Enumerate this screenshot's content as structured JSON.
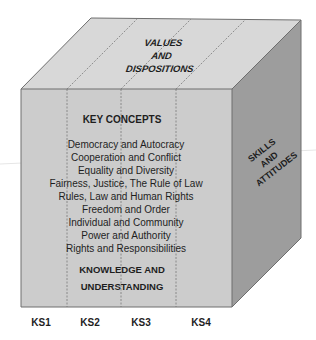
{
  "top_face": {
    "lines": [
      "VALUES",
      "AND",
      "DISPOSITIONS"
    ]
  },
  "front_face": {
    "heading": "KEY CONCEPTS",
    "concepts": [
      "Democracy and Autocracy",
      "Cooperation and Conflict",
      "Equality and Diversity",
      "Fairness, Justice, The Rule of Law",
      "Rules, Law and Human Rights",
      "Freedom and Order",
      "Individual and Community",
      "Power and Authority",
      "Rights and Responsibilities"
    ],
    "footer_lines": [
      "KNOWLEDGE AND",
      "UNDERSTANDING"
    ]
  },
  "side_face": {
    "lines": [
      "SKILLS",
      "AND",
      "ATTITUDES"
    ]
  },
  "key_stages": [
    "KS1",
    "KS2",
    "KS3",
    "KS4"
  ],
  "colors": {
    "top": "#d8d8d8",
    "front": "#cccccc",
    "side": "#9d9d9d",
    "edge": "#6e6e6e",
    "divider": "#7a7a7a",
    "text": "#1e1e1e"
  }
}
